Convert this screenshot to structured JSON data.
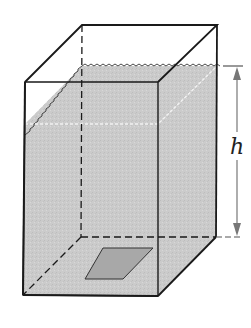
{
  "diagram": {
    "type": "rectangular-tank-with-water",
    "labels": {
      "height": "h"
    },
    "colors": {
      "water": "#c8c8c8",
      "water_front": "#cfcfcf",
      "edge": "#1a1a1a",
      "arrow": "#777777",
      "base_patch": "#a9a9a9",
      "waterline": "#f0f0f0"
    }
  }
}
